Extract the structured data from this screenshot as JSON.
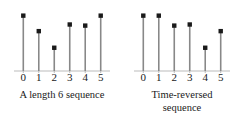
{
  "figure": {
    "background_color": "#ffffff",
    "stem_color": "#888888",
    "marker_color": "#1a1a1a",
    "axis_color": "#bbbbbb",
    "text_color": "#1a1a1a"
  },
  "chart_data": [
    {
      "type": "stem",
      "panel": "left",
      "title": "",
      "caption_lines": [
        "A length 6 sequence"
      ],
      "xlabel": "",
      "ylabel": "",
      "x": [
        0,
        1,
        2,
        3,
        4,
        5
      ],
      "categories": [
        "0",
        "1",
        "2",
        "3",
        "4",
        "5"
      ],
      "values": [
        5,
        3.6,
        2.1,
        4.2,
        4.1,
        5
      ],
      "xlim": [
        -0.6,
        5.6
      ],
      "ylim": [
        0,
        5.6
      ],
      "grid": false,
      "legend": null,
      "marker": "filled-square",
      "baseline": 0
    },
    {
      "type": "stem",
      "panel": "right",
      "title": "",
      "caption_lines": [
        "Time-reversed",
        "sequence"
      ],
      "xlabel": "",
      "ylabel": "",
      "x": [
        0,
        1,
        2,
        3,
        4,
        5
      ],
      "categories": [
        "0",
        "1",
        "2",
        "3",
        "4",
        "5"
      ],
      "values": [
        5,
        5,
        4.1,
        4.2,
        2.1,
        3.6
      ],
      "xlim": [
        -0.6,
        5.6
      ],
      "ylim": [
        0,
        5.6
      ],
      "grid": false,
      "legend": null,
      "marker": "filled-square",
      "baseline": 0
    }
  ]
}
